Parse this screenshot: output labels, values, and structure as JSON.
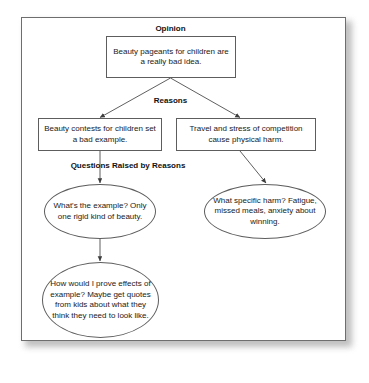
{
  "diagram": {
    "frame": {
      "border_color": "#6e6e6e",
      "background": "#ffffff",
      "shadow_color": "#b4b4b4"
    },
    "line_color": "#4d4d4d",
    "labels": [
      {
        "id": "opinion-label",
        "text": "Opinion"
      },
      {
        "id": "reasons-label",
        "text": "Reasons"
      },
      {
        "id": "questions-label",
        "text": "Questions Raised by Reasons"
      }
    ],
    "nodes": [
      {
        "id": "opinion-box",
        "shape": "box",
        "text": "Beauty pageants for children are a really bad idea.",
        "lines": [
          "Beauty pageants for children",
          "are a really bad idea."
        ]
      },
      {
        "id": "reason-left-box",
        "shape": "box",
        "text": "Beauty contests for children set a bad example.",
        "lines": [
          "Beauty contests for children",
          "set a bad example."
        ]
      },
      {
        "id": "reason-right-box",
        "shape": "box",
        "text": "Travel and stress of competition cause physical harm.",
        "lines": [
          "Travel and stress of competition",
          "cause physical harm."
        ]
      },
      {
        "id": "question-left-ellipse",
        "shape": "ellipse",
        "text": "What's the example? Only one rigid kind of beauty.",
        "lines": [
          "What's the example?",
          "Only one rigid",
          "kind of beauty."
        ]
      },
      {
        "id": "question-right-ellipse",
        "shape": "ellipse",
        "text": "What specific harm? Fatigue, missed meals, anxiety about winning.",
        "lines": [
          "What specific harm?",
          "Fatigue, missed meals,",
          "anxiety about winning."
        ]
      },
      {
        "id": "question-bottom-ellipse",
        "shape": "ellipse",
        "text": "How would I prove effects of example? Maybe get quotes from kids about what they think they need to look like.",
        "lines": [
          "How would I prove",
          "effects of example?",
          "Maybe get quotes",
          "from kids about what",
          "they think they",
          "need to look like."
        ]
      }
    ],
    "connectors": [
      {
        "id": "opinion-to-reason-left",
        "from": "opinion-box",
        "to": "reason-left-box",
        "style": "arrow-diagonal-left"
      },
      {
        "id": "opinion-to-reason-right",
        "from": "opinion-box",
        "to": "reason-right-box",
        "style": "arrow-diagonal-right"
      },
      {
        "id": "reason-left-to-question-left",
        "from": "reason-left-box",
        "to": "question-left-ellipse",
        "style": "arrow-vertical"
      },
      {
        "id": "reason-right-to-question-right",
        "from": "reason-right-box",
        "to": "question-right-ellipse",
        "style": "arrow-diagonal-right"
      },
      {
        "id": "question-left-to-question-bottom",
        "from": "question-left-ellipse",
        "to": "question-bottom-ellipse",
        "style": "arrow-vertical"
      }
    ]
  }
}
